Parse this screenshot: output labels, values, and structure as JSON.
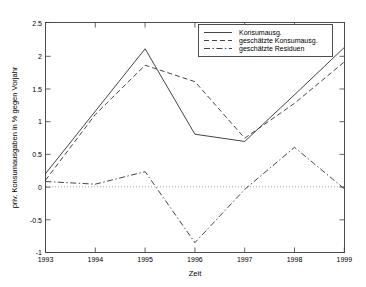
{
  "chart_data": {
    "type": "line",
    "title": "",
    "xlabel": "Zeit",
    "ylabel": "priv. Konsumausgaben in % gegen Vorjahr",
    "x": [
      1993,
      1994,
      1995,
      1996,
      1997,
      1998,
      1999
    ],
    "xlim": [
      1993,
      1999
    ],
    "ylim": [
      -1,
      2.5
    ],
    "xticks": [
      "1993",
      "1994",
      "1995",
      "1996",
      "1997",
      "1998",
      "1999"
    ],
    "yticks": [
      "-1",
      "-0.5",
      "0",
      "0.5",
      "1",
      "1.5",
      "2",
      "2.5"
    ],
    "grid": false,
    "legend_position": "top-right",
    "zero_reference_line": 0,
    "series": [
      {
        "name": "Konsumausg.",
        "style": "solid",
        "values": [
          0.2,
          1.15,
          2.1,
          0.8,
          0.69,
          1.4,
          2.12
        ]
      },
      {
        "name": "geschätzte Konsumausg.",
        "style": "dashed",
        "values": [
          0.1,
          1.1,
          1.85,
          1.6,
          0.74,
          1.27,
          1.9
        ]
      },
      {
        "name": "geschätzte Residuen",
        "style": "dash-dot",
        "values": [
          0.08,
          0.04,
          0.23,
          -0.85,
          -0.04,
          0.6,
          -0.03
        ]
      }
    ],
    "legend_entries": [
      "Konsumausg.",
      "geschätzte Konsumausg.",
      "geschätzte Residuen"
    ]
  }
}
